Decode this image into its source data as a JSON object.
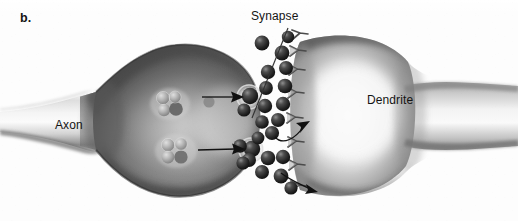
{
  "figure": {
    "panel_letter": "b.",
    "caption_labels": {
      "synapse": "Synapse",
      "axon": "Axon",
      "dendrite": "Dendrite"
    },
    "style": "grayscale airbrush textbook illustration",
    "colors": {
      "background": "#fdfdfd",
      "text": "#141414",
      "neuron_light": "#e8e8e8",
      "neuron_mid": "#9a9a9a",
      "neuron_dark": "#4a4a4a",
      "neurotransmitter": "#2b2b2b",
      "leader_line": "#333333",
      "arrow": "#111111"
    }
  },
  "annotations": {
    "leader_lines": [
      {
        "name": "synapse-leader-line",
        "from_label": "Synapse",
        "x1": 288,
        "y1": 28,
        "x2": 252,
        "y2": 118
      }
    ],
    "arrows": [
      {
        "name": "vesicle-release-arrow-upper",
        "type": "straight",
        "x1": 202,
        "y1": 97,
        "x2": 243,
        "y2": 97,
        "meaning": "vesicle moving toward presynaptic membrane"
      },
      {
        "name": "vesicle-release-arrow-lower",
        "type": "straight",
        "x1": 205,
        "y1": 149,
        "x2": 244,
        "y2": 149,
        "meaning": "vesicle moving toward presynaptic membrane"
      },
      {
        "name": "neurotransmitter-binding-arrow-upper",
        "type": "curved",
        "x1": 277,
        "y1": 133,
        "x2": 312,
        "y2": 122,
        "meaning": "neurotransmitter binding to receptor"
      },
      {
        "name": "neurotransmitter-binding-arrow-lower",
        "type": "curved",
        "x1": 284,
        "y1": 176,
        "x2": 318,
        "y2": 190,
        "meaning": "neurotransmitter binding to receptor"
      }
    ]
  },
  "structures": {
    "axon_terminal": {
      "name": "presynaptic-axon-terminal",
      "description": "bulb-shaped terminal at right end of tapering axon"
    },
    "dendrite": {
      "name": "postsynaptic-dendrite",
      "description": "rounded dendritic surface bearing receptors"
    },
    "synaptic_cleft": {
      "name": "synaptic-cleft",
      "description": "narrow white gap filled with neurotransmitter molecules"
    },
    "vesicle_clusters": [
      {
        "name": "synaptic-vesicle-cluster-upper",
        "cx": 170,
        "cy": 104
      },
      {
        "name": "synaptic-vesicle-cluster-lower",
        "cx": 176,
        "cy": 151
      }
    ],
    "receptor_count": 8,
    "neurotransmitter_count": 22
  }
}
